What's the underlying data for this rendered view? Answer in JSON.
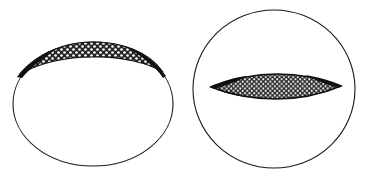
{
  "figure": {
    "background_color": "#ffffff",
    "ink_color": "#1a1a1a",
    "stipple_fill_color": "#2b2b2b",
    "stipple_dot_color": "#ffffff",
    "canvas": {
      "width": 375,
      "height": 182
    },
    "panels": [
      {
        "id": "left-panel",
        "name": "left-ellipse-figure",
        "outer_shape": {
          "type": "ellipse",
          "name": "ellipse-outline",
          "cx": 93,
          "cy": 104,
          "rx": 80,
          "ry": 62,
          "stroke_width": 1.1,
          "fill": "none"
        },
        "inclusion": {
          "type": "crescent",
          "name": "stippled-crescent",
          "position": "upper",
          "left_tip_x": 20,
          "right_tip_x": 163,
          "center_x": 93,
          "center_y": 65,
          "max_thickness": 9,
          "stroke_width": 1.2
        }
      },
      {
        "id": "right-panel",
        "name": "right-circle-figure",
        "outer_shape": {
          "type": "circle",
          "name": "circle-outline",
          "cx": 274,
          "cy": 89,
          "rx": 81,
          "ry": 79,
          "stroke_width": 1.1,
          "fill": "none"
        },
        "inclusion": {
          "type": "lens",
          "name": "stippled-lens",
          "position": "center",
          "left_tip_x": 211,
          "right_tip_x": 341,
          "center_x": 276,
          "center_y": 86,
          "max_thickness": 20,
          "stroke_width": 1.4
        }
      }
    ]
  }
}
